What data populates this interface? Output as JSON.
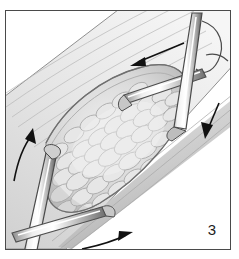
{
  "figure": {
    "number_label": "3",
    "caption_text": "",
    "style": "grayscale line-and-wash surgical illustration",
    "border_color": "#4a4a4a",
    "background_color": "#ffffff",
    "frame": {
      "x": 5,
      "y": 10,
      "width": 226,
      "height": 240
    }
  },
  "palette": {
    "ink": "#1c1c1c",
    "outline": "#3a3a3a",
    "tissue_light": "#f0f0f0",
    "tissue_mid": "#d9d9d9",
    "tissue_shadow": "#b4b4b4",
    "tissue_dark": "#9a9a9a",
    "lumen_fill": "#e4e4e4",
    "metal_highlight": "#ffffff",
    "metal_mid": "#c9c9c9",
    "metal_shadow": "#6e6e6e",
    "arrow_color": "#111111"
  },
  "scene": {
    "name": "tubular-organ-with-longitudinal-opening",
    "description": "Diagonal tubular structure running from upper-right to lower-left, opened longitudinally to expose lobulated inner tissue, with surgical instruments and suture, plus four directional arrows.",
    "band": {
      "name": "diagonal-tubular-structure",
      "angle_degrees": -34,
      "upper_edge_points": "18,96 82,46 150,6 232,-40",
      "lower_edge_points": "40,252 120,196 200,140 250,104"
    },
    "lumen": {
      "name": "opened-lumen-cavity",
      "description": "Elliptical opening between the retracted walls showing packed lobulated mucosal tissue"
    },
    "texture": {
      "name": "lobulated-tissue-texture",
      "lobule_count_estimate": 78,
      "description": "Rows of overlapping oval lobules shaded from light grey to mid grey"
    }
  },
  "instruments": [
    {
      "name": "instrument-vertical-right",
      "label": "",
      "type": "needle-holder-shaft",
      "position": "upper-right",
      "orientation": "near-vertical",
      "from": {
        "x": 196,
        "y": 12
      },
      "to": {
        "x": 178,
        "y": 118
      }
    },
    {
      "name": "instrument-horizontal-upper",
      "label": "",
      "type": "clamp-jaw",
      "position": "upper-middle-right",
      "orientation": "horizontal-slight-tilt",
      "from": {
        "x": 128,
        "y": 82
      },
      "to": {
        "x": 198,
        "y": 62
      }
    },
    {
      "name": "instrument-left-shaft",
      "label": "",
      "type": "retractor-shaft",
      "position": "left-middle",
      "orientation": "steep-diagonal",
      "from": {
        "x": 42,
        "y": 146
      },
      "to": {
        "x": 18,
        "y": 248
      }
    },
    {
      "name": "instrument-horizontal-lower",
      "label": "",
      "type": "clamp-jaw",
      "position": "lower-left",
      "orientation": "horizontal-slight-tilt",
      "from": {
        "x": 24,
        "y": 226
      },
      "to": {
        "x": 100,
        "y": 206
      }
    }
  ],
  "suture": {
    "name": "suture-loop",
    "description": "Thin curved suture loop arcing from the top-right instrument tip over to the right wall",
    "visible": true
  },
  "arrows": [
    {
      "name": "arrow-upper-left-direction",
      "direction": "left-down",
      "tail": {
        "x": 182,
        "y": 44
      },
      "head": {
        "x": 131,
        "y": 63
      },
      "curved": false
    },
    {
      "name": "arrow-right-down-direction",
      "direction": "down-left",
      "tail": {
        "x": 216,
        "y": 102
      },
      "head": {
        "x": 205,
        "y": 134
      },
      "curved": false
    },
    {
      "name": "arrow-left-up-direction",
      "direction": "up-right",
      "tail": {
        "x": 13,
        "y": 178
      },
      "head": {
        "x": 30,
        "y": 133
      },
      "curved": true
    },
    {
      "name": "arrow-bottom-right-direction",
      "direction": "right-up",
      "tail": {
        "x": 82,
        "y": 248
      },
      "head": {
        "x": 124,
        "y": 235
      },
      "curved": true
    }
  ]
}
